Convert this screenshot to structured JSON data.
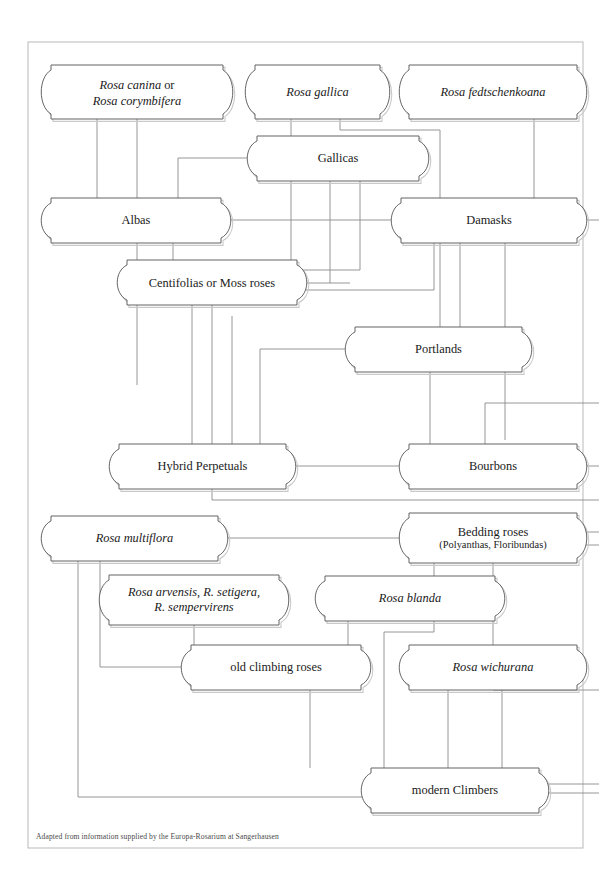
{
  "document": {
    "type": "genealogy-diagram",
    "subject": "Rose garden groups ancestry chart",
    "caption": "Adapted from information supplied by the Europa-Rosarium at Sangerhausen",
    "page_border": {
      "color": "#b9b9b9",
      "x": 28,
      "y": 42,
      "width": 555,
      "height": 806
    },
    "colors": {
      "background": "#ffffff",
      "box_stroke": "#5c5c5c",
      "box_shadow": "#c9c9c9",
      "connector": "#8a8a8a",
      "text": "#1a1a1a",
      "caption_text": "#4a4a4a"
    }
  },
  "nodes": [
    {
      "id": "rosa-canina",
      "name": "rosa-canina-corymbifera",
      "lines": [
        {
          "text": "Rosa canina",
          "style": "italic"
        },
        {
          "text": " or",
          "style": "roman"
        },
        {
          "text": "Rosa corymbifera",
          "style": "italic"
        }
      ],
      "display": "Rosa canina or Rosa corymbifera",
      "x": 46,
      "y": 65,
      "w": 182,
      "h": 54
    },
    {
      "id": "rosa-gallica",
      "name": "rosa-gallica",
      "lines": [
        {
          "text": "Rosa gallica",
          "style": "italic"
        }
      ],
      "display": "Rosa gallica",
      "x": 250,
      "y": 65,
      "w": 135,
      "h": 54
    },
    {
      "id": "rosa-fedtschenkoana",
      "name": "rosa-fedtschenkoana",
      "lines": [
        {
          "text": "Rosa fedtschenkoana",
          "style": "italic"
        }
      ],
      "display": "Rosa fedtschenkoana",
      "x": 404,
      "y": 65,
      "w": 178,
      "h": 54
    },
    {
      "id": "gallicas",
      "name": "gallicas",
      "lines": [
        {
          "text": "Gallicas",
          "style": "roman"
        }
      ],
      "display": "Gallicas",
      "x": 252,
      "y": 136,
      "w": 172,
      "h": 45
    },
    {
      "id": "albas",
      "name": "albas",
      "lines": [
        {
          "text": "Albas",
          "style": "roman"
        }
      ],
      "display": "Albas",
      "x": 46,
      "y": 198,
      "w": 180,
      "h": 45
    },
    {
      "id": "damasks",
      "name": "damasks",
      "lines": [
        {
          "text": "Damasks",
          "style": "roman"
        }
      ],
      "display": "Damasks",
      "x": 396,
      "y": 198,
      "w": 186,
      "h": 45
    },
    {
      "id": "centifolias",
      "name": "centifolias-moss-roses",
      "lines": [
        {
          "text": "Centifolias",
          "style": "roman"
        },
        {
          "text": " or Moss roses",
          "style": "roman"
        }
      ],
      "display": "Centifolias or Moss roses",
      "x": 122,
      "y": 260,
      "w": 180,
      "h": 45
    },
    {
      "id": "portlands",
      "name": "portlands",
      "lines": [
        {
          "text": "Portlands",
          "style": "roman"
        }
      ],
      "display": "Portlands",
      "x": 350,
      "y": 327,
      "w": 177,
      "h": 45
    },
    {
      "id": "hybrid-perpetuals",
      "name": "hybrid-perpetuals",
      "lines": [
        {
          "text": "Hybrid Perpetuals",
          "style": "roman"
        }
      ],
      "display": "Hybrid Perpetuals",
      "x": 114,
      "y": 444,
      "w": 177,
      "h": 45
    },
    {
      "id": "bourbons",
      "name": "bourbons",
      "lines": [
        {
          "text": "Bourbons",
          "style": "roman"
        }
      ],
      "display": "Bourbons",
      "x": 404,
      "y": 444,
      "w": 178,
      "h": 45
    },
    {
      "id": "rosa-multiflora",
      "name": "rosa-multiflora",
      "lines": [
        {
          "text": "Rosa multiflora",
          "style": "italic"
        }
      ],
      "display": "Rosa multiflora",
      "x": 46,
      "y": 516,
      "w": 177,
      "h": 45
    },
    {
      "id": "bedding-roses",
      "name": "bedding-roses",
      "lines": [
        {
          "text": "Bedding roses",
          "style": "roman"
        },
        {
          "text": "(Polyanthas, Floribundas)",
          "style": "sub"
        }
      ],
      "display": "Bedding roses (Polyanthas, Floribundas)",
      "x": 404,
      "y": 513,
      "w": 178,
      "h": 50
    },
    {
      "id": "rosa-arvensis",
      "name": "rosa-arvensis-setigera-sempervirens",
      "lines": [
        {
          "text": "Rosa arvensis, R. setigera,",
          "style": "italic"
        },
        {
          "text": "R. sempervirens",
          "style": "italic"
        }
      ],
      "display": "Rosa arvensis, R. setigera, R. sempervirens",
      "x": 104,
      "y": 575,
      "w": 180,
      "h": 50
    },
    {
      "id": "rosa-blanda",
      "name": "rosa-blanda",
      "lines": [
        {
          "text": "Rosa blanda",
          "style": "italic"
        }
      ],
      "display": "Rosa blanda",
      "x": 320,
      "y": 576,
      "w": 180,
      "h": 45
    },
    {
      "id": "old-climbing-roses",
      "name": "old-climbing-roses",
      "lines": [
        {
          "text": "old climbing roses",
          "style": "roman"
        }
      ],
      "display": "old climbing roses",
      "x": 186,
      "y": 645,
      "w": 180,
      "h": 45
    },
    {
      "id": "rosa-wichurana",
      "name": "rosa-wichurana",
      "lines": [
        {
          "text": "Rosa wichurana",
          "style": "italic"
        }
      ],
      "display": "Rosa wichurana",
      "x": 404,
      "y": 645,
      "w": 178,
      "h": 45
    },
    {
      "id": "modern-climbers",
      "name": "modern-climbers",
      "lines": [
        {
          "text": "modern Climbers",
          "style": "roman"
        }
      ],
      "display": "modern Climbers",
      "x": 366,
      "y": 768,
      "w": 178,
      "h": 45
    }
  ],
  "connectors": [
    {
      "name": "canina-to-albas",
      "d": "M 97 119 L 97 198"
    },
    {
      "name": "canina-to-gallicas-area",
      "d": "M 137 119 L 137 385"
    },
    {
      "name": "gallica-to-gallicas",
      "d": "M 291 119 L 291 136"
    },
    {
      "name": "gallica-right-to-portlands-branch",
      "d": "M 340 119 L 340 130 L 440 130 L 440 327"
    },
    {
      "name": "fedtschenkoana-down",
      "d": "M 534 119 L 534 198"
    },
    {
      "name": "gallicas-left-to-albas",
      "d": "M 252 158 L 178 158 L 178 240"
    },
    {
      "name": "gallicas-right-to-damasks",
      "d": "M 424 220 L 396 220"
    },
    {
      "name": "albas-right-join",
      "d": "M 226 220 L 396 220"
    },
    {
      "name": "gallicas-under-1",
      "d": "M 291 181 L 291 280 L 302 280"
    },
    {
      "name": "gallicas-under-2",
      "d": "M 330 181 L 330 283"
    },
    {
      "name": "gallicas-under-3",
      "d": "M 360 181 L 360 270 L 302 270"
    },
    {
      "name": "albas-to-centifolias",
      "d": "M 173 243 L 173 260"
    },
    {
      "name": "damasks-down-1",
      "d": "M 434 243 L 434 290 L 302 290"
    },
    {
      "name": "damasks-down-2",
      "d": "M 460 243 L 460 327"
    },
    {
      "name": "damasks-down-3",
      "d": "M 505 243 L 505 440"
    },
    {
      "name": "damasks-right-out",
      "d": "M 582 220 L 599 220"
    },
    {
      "name": "centifolias-right-out",
      "d": "M 302 283 L 350 283"
    },
    {
      "name": "centifolias-down",
      "d": "M 212 305 L 212 444"
    },
    {
      "name": "centifolias-down-2",
      "d": "M 192 305 L 192 444"
    },
    {
      "name": "portlands-left-in",
      "d": "M 350 349 L 260 349 L 260 444"
    },
    {
      "name": "portlands-down",
      "d": "M 430 372 L 430 444"
    },
    {
      "name": "portlands-bottom-line",
      "d": "M 232 316 L 232 444"
    },
    {
      "name": "right-edge-in-high",
      "d": "M 599 403 L 485 403 L 485 444"
    },
    {
      "name": "hp-to-bourbons",
      "d": "M 291 466 L 404 466"
    },
    {
      "name": "bourbons-right-out",
      "d": "M 582 466 L 599 466"
    },
    {
      "name": "hp-bottom-to-right",
      "d": "M 212 489 L 212 500 L 599 500"
    },
    {
      "name": "multiflora-to-bedding",
      "d": "M 223 538 L 404 538"
    },
    {
      "name": "bedding-right-out-1",
      "d": "M 582 532 L 599 532"
    },
    {
      "name": "bedding-right-out-2",
      "d": "M 582 545 L 599 545"
    },
    {
      "name": "multiflora-down-a",
      "d": "M 78 561 L 78 797 L 366 797"
    },
    {
      "name": "multiflora-down-b",
      "d": "M 100 561 L 100 667 L 186 667"
    },
    {
      "name": "bedding-down",
      "d": "M 493 563 L 493 690 L 599 690"
    },
    {
      "name": "arvensis-to-oldclimbing",
      "d": "M 194 625 L 194 645"
    },
    {
      "name": "blanda-down-left",
      "d": "M 348 621 L 348 645"
    },
    {
      "name": "blanda-right-down",
      "d": "M 434 563 L 434 632 L 384 632 L 384 768"
    },
    {
      "name": "oldclimbing-down",
      "d": "M 310 690 L 310 768"
    },
    {
      "name": "wichurana-down-1",
      "d": "M 448 690 L 448 768"
    },
    {
      "name": "wichurana-down-2",
      "d": "M 502 690 L 502 768"
    },
    {
      "name": "modern-climbers-right-1",
      "d": "M 544 784 L 599 784"
    },
    {
      "name": "modern-climbers-right-2",
      "d": "M 544 793 L 599 793"
    }
  ]
}
